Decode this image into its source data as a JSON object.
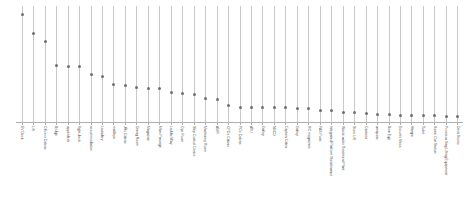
{
  "chart_data": {
    "type": "scatter",
    "title": "",
    "subtitle": "",
    "xlabel": "",
    "ylabel": "",
    "grid": "vertical-only",
    "legend": "none",
    "marker": "small-gray-dot",
    "ylim": [
      0,
      100
    ],
    "categories": [
      "EV Deck",
      "Lift",
      "Officers Cabins",
      "Bridge",
      "upperdeck",
      "flight deck",
      "accommodation",
      "Laundary",
      "maldeps",
      "JRs Cabins",
      "Dining Room",
      "Magazine",
      "Main Passage",
      "Ladder/Way",
      "Ops Room",
      "Ship Control Centre",
      "Machinery Room",
      "AMR",
      "CPOs Cabins",
      "POs Cabins",
      "ATU",
      "Galley",
      "NBCD",
      "Captain Cabin",
      "Galley",
      "RO magazines",
      "FAS Point",
      "Integrated Platform Maintenance",
      "Waste water Treatment Plant",
      "Store Lift",
      "Canteen",
      "weapons",
      "Bow Eqp",
      "Escort's Mess",
      "Hangar",
      "Toilet",
      "Sonar Out Station",
      "Provision Bag Lifting Equipment",
      "Deck Stores"
    ],
    "values": [
      93,
      77,
      70,
      49,
      48,
      48,
      41,
      40,
      33,
      32,
      30,
      29,
      29,
      26,
      25,
      24,
      21,
      20,
      15,
      13,
      13,
      13,
      13,
      13,
      12,
      12,
      10,
      10,
      9,
      9,
      8,
      7,
      7,
      6,
      6,
      6,
      6,
      5,
      5
    ]
  }
}
